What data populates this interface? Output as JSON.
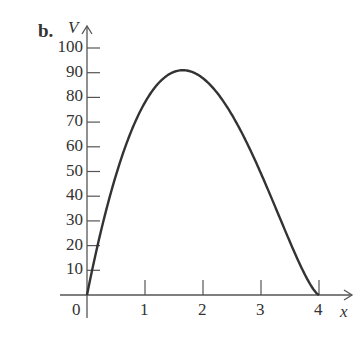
{
  "label": "b.",
  "chart_data": {
    "type": "line",
    "title": "",
    "xlabel": "x",
    "ylabel": "V",
    "xlim": [
      0,
      4
    ],
    "ylim": [
      0,
      100
    ],
    "x_ticks": [
      "0",
      "1",
      "2",
      "3",
      "4"
    ],
    "y_ticks": [
      "10",
      "20",
      "30",
      "40",
      "50",
      "60",
      "70",
      "80",
      "90",
      "100"
    ],
    "x": [
      0,
      0.25,
      0.5,
      0.75,
      1,
      1.25,
      1.5,
      1.65,
      1.75,
      2,
      2.25,
      2.5,
      2.75,
      3,
      3.25,
      3.5,
      3.75,
      4
    ],
    "values": [
      0,
      38,
      60,
      75,
      84,
      89,
      91,
      91,
      90.5,
      88,
      83,
      75,
      65,
      53,
      39,
      25,
      12,
      0
    ]
  }
}
